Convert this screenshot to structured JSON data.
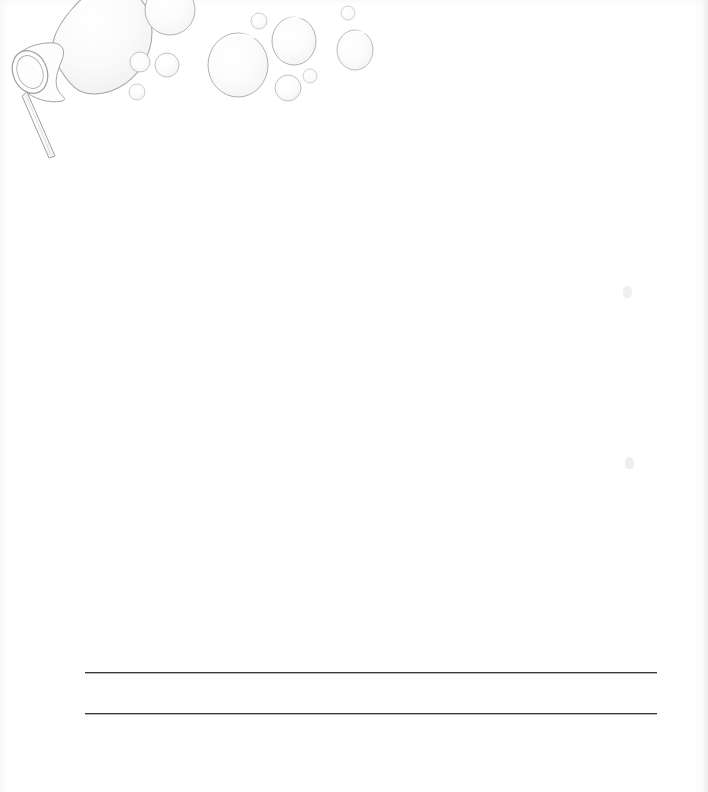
{
  "document": {
    "kind": "printable-stationery-page",
    "title": "Bubble Wand Writing Paper",
    "page_width": 708,
    "page_height": 792,
    "background_color": "#ffffff",
    "body_text": "",
    "orientation": "portrait"
  },
  "illustration": {
    "name": "bubble-wand-with-soap-bubbles",
    "description": "Line-art bubble wand at the upper left blowing a large soap bubble, with smaller bubbles drifting to the right across the top of the page",
    "stroke_color": "#b9b9bd",
    "fill_color": "#fbfbfc",
    "highlight_color": "#ffffff",
    "wand": {
      "name": "bubble-wand",
      "ring_center_x": 30,
      "ring_center_y": 72,
      "ring_radius_x": 17,
      "ring_radius_y": 22,
      "handle_start_x": 30,
      "handle_start_y": 90,
      "handle_end_x": 54,
      "handle_end_y": 156
    },
    "bubbles": [
      {
        "name": "bubble-attached-to-wand",
        "cx": 98,
        "cy": 14,
        "rx": 52,
        "ry": 56
      },
      {
        "name": "bubble-top-left-upper",
        "cx": 170,
        "cy": 10,
        "rx": 25,
        "ry": 25
      },
      {
        "name": "bubble-small-a",
        "cx": 140,
        "cy": 62,
        "rx": 10,
        "ry": 10
      },
      {
        "name": "bubble-small-b",
        "cx": 167,
        "cy": 65,
        "rx": 12,
        "ry": 12
      },
      {
        "name": "bubble-tiny-a",
        "cx": 137,
        "cy": 92,
        "rx": 8,
        "ry": 8
      },
      {
        "name": "bubble-center-large",
        "cx": 238,
        "cy": 65,
        "rx": 30,
        "ry": 32
      },
      {
        "name": "bubble-tiny-b",
        "cx": 259,
        "cy": 21,
        "rx": 8,
        "ry": 8
      },
      {
        "name": "bubble-upper-right",
        "cx": 294,
        "cy": 41,
        "rx": 22,
        "ry": 24
      },
      {
        "name": "bubble-tiny-c",
        "cx": 348,
        "cy": 13,
        "rx": 7,
        "ry": 7
      },
      {
        "name": "bubble-right-mid",
        "cx": 355,
        "cy": 50,
        "rx": 18,
        "ry": 20
      },
      {
        "name": "bubble-small-c",
        "cx": 288,
        "cy": 88,
        "rx": 13,
        "ry": 13
      },
      {
        "name": "bubble-tiny-d",
        "cx": 310,
        "cy": 76,
        "rx": 7,
        "ry": 7
      }
    ]
  },
  "writing_lines": {
    "name": "writing-lines",
    "count": 2,
    "line_color": "#3a3a3c",
    "left_x": 85,
    "right_x": 657,
    "lines": [
      {
        "name": "writing-line-1",
        "y": 672
      },
      {
        "name": "writing-line-2",
        "y": 713
      }
    ]
  },
  "scan_artifacts": [
    {
      "name": "scan-speck-upper-right",
      "x": 623,
      "y": 286,
      "w": 9,
      "h": 12
    },
    {
      "name": "scan-speck-mid-right",
      "x": 625,
      "y": 457,
      "w": 9,
      "h": 12
    }
  ]
}
